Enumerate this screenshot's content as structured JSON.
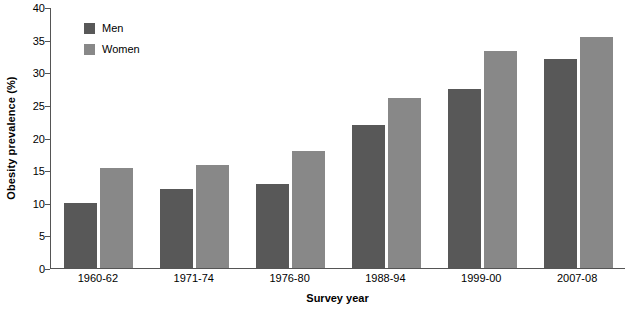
{
  "chart_data": {
    "type": "bar",
    "title": "",
    "xlabel": "Survey year",
    "ylabel": "Obesity prevalence (%)",
    "categories": [
      "1960-62",
      "1971-74",
      "1976-80",
      "1988-94",
      "1999-00",
      "2007-08"
    ],
    "series": [
      {
        "name": "Men",
        "color": "#585858",
        "values": [
          9.9,
          12.1,
          12.8,
          21.9,
          27.4,
          32.1
        ]
      },
      {
        "name": "Women",
        "color": "#888888",
        "values": [
          15.3,
          15.8,
          17.9,
          26.0,
          33.3,
          35.4
        ]
      }
    ],
    "ylim": [
      0,
      40
    ],
    "yticks": [
      0,
      5,
      10,
      15,
      20,
      25,
      30,
      35,
      40
    ],
    "ytick_labels": [
      "0",
      "5",
      "10",
      "15",
      "20",
      "25",
      "30",
      "35",
      "40"
    ],
    "grid": false,
    "legend_position": "upper left",
    "bar_group_gap_ratio": 0.28,
    "bar_inner_gap_px": 3
  },
  "axes": {
    "y_title": "Obesity prevalence (%)",
    "x_title": "Survey year"
  },
  "legend": {
    "entries": [
      {
        "label": "Men",
        "color": "#585858"
      },
      {
        "label": "Women",
        "color": "#888888"
      }
    ]
  }
}
